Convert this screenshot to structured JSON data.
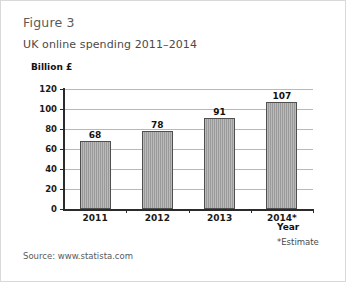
{
  "figure": {
    "label": "Figure 3",
    "title": "UK online spending 2011–2014",
    "source": "Source: www.statista.com",
    "estimate_note": "*Estimate"
  },
  "chart_data": {
    "type": "bar",
    "title": "UK online spending 2011–2014",
    "categories": [
      "2011",
      "2012",
      "2013",
      "2014*"
    ],
    "values": [
      68,
      78,
      91,
      107
    ],
    "xlabel": "Year",
    "ylabel": "Billion £",
    "ylim": [
      0,
      120
    ],
    "yticks": [
      0,
      20,
      40,
      60,
      80,
      100,
      120
    ],
    "ytick_labels": [
      "0",
      "20",
      "40",
      "60",
      "80",
      "100",
      "120"
    ],
    "grid": true,
    "legend": false,
    "data_labels": [
      "68",
      "78",
      "91",
      "107"
    ],
    "annotations": [
      "*Estimate",
      "Source: www.statista.com"
    ],
    "series": [
      {
        "name": "UK online spending (Billion £)",
        "values": [
          68,
          78,
          91,
          107
        ]
      }
    ],
    "colors": {
      "bar_fill": "#9a9a9a",
      "bar_border": "#4f4f4f",
      "gridline": "#b8b8b8",
      "axis": "#2b2b2b",
      "background": "#ffffff",
      "card_border": "#d9d9d9"
    }
  }
}
